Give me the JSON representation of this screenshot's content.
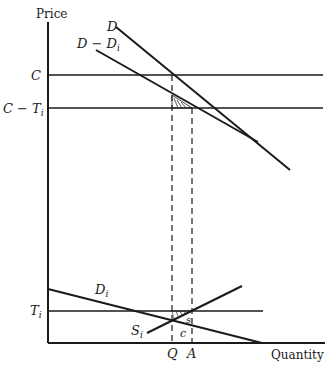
{
  "diagram": {
    "axes": {
      "y_label": "Price",
      "x_label": "Quantity"
    },
    "price_levels": {
      "c": "C",
      "c_minus_ti_main": "C − T",
      "c_minus_ti_sub": "i",
      "ti_main": "T",
      "ti_sub": "i"
    },
    "curves": {
      "d": "D",
      "d_minus_di_main": "D − D",
      "d_minus_di_sub": "i",
      "di_main": "D",
      "di_sub": "i",
      "si_main": "S",
      "si_sub": "i"
    },
    "quantities": {
      "q": "Q",
      "a": "A"
    },
    "region_labels": {
      "s": "s",
      "c": "c"
    },
    "colors": {
      "ink": "#1a1a1a",
      "background": "#ffffff"
    }
  }
}
